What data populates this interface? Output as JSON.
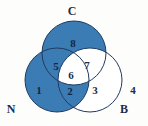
{
  "diagram": {
    "type": "venn-3-set",
    "title_visible": false,
    "background_color": "#fdfdfb",
    "fill_color": "#3c7cb4",
    "unfilled_color": "#ffffff",
    "outline_color": "#1f3a5f",
    "text_color": "#1d2d4a",
    "set_labels": [
      {
        "key": "C",
        "text": "C",
        "position": "top"
      },
      {
        "key": "N",
        "text": "N",
        "position": "bottom-left"
      },
      {
        "key": "B",
        "text": "B",
        "position": "bottom-right"
      }
    ],
    "regions": [
      {
        "id": "1",
        "label": "1",
        "belongs_to": "N only",
        "shaded": true
      },
      {
        "id": "2",
        "label": "2",
        "belongs_to": "N and B",
        "shaded": true
      },
      {
        "id": "3",
        "label": "3",
        "belongs_to": "B only",
        "shaded": false
      },
      {
        "id": "4",
        "label": "4",
        "belongs_to": "outside all sets",
        "shaded": false
      },
      {
        "id": "5",
        "label": "5",
        "belongs_to": "N and C",
        "shaded": true
      },
      {
        "id": "6",
        "label": "6",
        "belongs_to": "N and C and B",
        "shaded": false
      },
      {
        "id": "7",
        "label": "7",
        "belongs_to": "C and B",
        "shaded": false
      },
      {
        "id": "8",
        "label": "8",
        "belongs_to": "C only",
        "shaded": true
      }
    ]
  }
}
